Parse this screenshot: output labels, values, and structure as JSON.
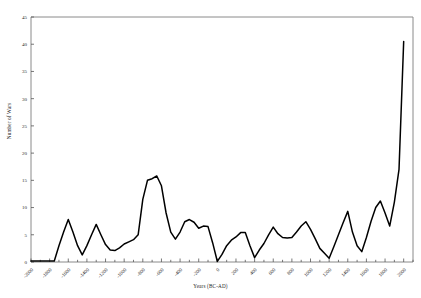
{
  "chart_data": {
    "type": "line",
    "title": "",
    "xlabel": "Years (BC-AD)",
    "ylabel": "Number of Wars",
    "xlim": [
      -2000,
      2100
    ],
    "ylim": [
      0,
      45
    ],
    "yticks": [
      0,
      5,
      10,
      15,
      20,
      25,
      30,
      35,
      40,
      45
    ],
    "xticks": [
      -2000,
      -1800,
      -1600,
      -1400,
      -1200,
      -1000,
      -800,
      -600,
      -400,
      -200,
      0,
      200,
      400,
      600,
      800,
      1000,
      1200,
      1400,
      1600,
      1800,
      2000
    ],
    "xtick_labels": [
      "-2000",
      "-1800",
      "-1600",
      "-1400",
      "-1200",
      "-1000",
      "-800",
      "-600",
      "-400",
      "-200",
      "0",
      "200",
      "400",
      "600",
      "800",
      "1000",
      "1200",
      "1400",
      "1600",
      "1800",
      "2000"
    ],
    "grid": false,
    "legend": null,
    "line_color": "#000000",
    "frame_color": "#8a8a8a",
    "x": [
      -2000,
      -1950,
      -1900,
      -1850,
      -1800,
      -1750,
      -1700,
      -1650,
      -1600,
      -1550,
      -1500,
      -1450,
      -1400,
      -1350,
      -1300,
      -1250,
      -1200,
      -1150,
      -1100,
      -1050,
      -1000,
      -950,
      -900,
      -850,
      -800,
      -750,
      -700,
      -650,
      -600,
      -550,
      -500,
      -450,
      -400,
      -350,
      -300,
      -250,
      -200,
      -150,
      -100,
      -50,
      0,
      50,
      100,
      150,
      200,
      250,
      300,
      350,
      400,
      450,
      500,
      550,
      600,
      650,
      700,
      750,
      800,
      850,
      900,
      950,
      1000,
      1050,
      1100,
      1150,
      1200,
      1250,
      1300,
      1350,
      1400,
      1450,
      1500,
      1550,
      1600,
      1650,
      1700,
      1750,
      1800,
      1850,
      1900,
      1950,
      2000
    ],
    "values": [
      0.2,
      0.2,
      0.2,
      0.2,
      0.2,
      0.2,
      3.0,
      5.5,
      7.8,
      5.5,
      3.0,
      1.3,
      3.0,
      5.0,
      6.9,
      5.0,
      3.2,
      2.2,
      2.1,
      2.6,
      3.3,
      3.7,
      4.1,
      5.0,
      11.5,
      15.0,
      15.3,
      15.8,
      14.0,
      9.0,
      5.5,
      4.2,
      5.5,
      7.4,
      7.8,
      7.3,
      6.2,
      6.6,
      6.5,
      3.5,
      0.1,
      1.4,
      3.0,
      4.0,
      4.6,
      5.4,
      5.4,
      3.0,
      0.8,
      2.2,
      3.4,
      5.0,
      6.4,
      5.2,
      4.5,
      4.4,
      4.5,
      5.5,
      6.6,
      7.4,
      6.0,
      4.3,
      2.5,
      1.6,
      0.7,
      2.8,
      5.0,
      7.2,
      9.3,
      5.5,
      3.0,
      1.9,
      4.5,
      7.5,
      10.0,
      11.2,
      9.0,
      6.6,
      11.0,
      17.0,
      40.5
    ]
  }
}
